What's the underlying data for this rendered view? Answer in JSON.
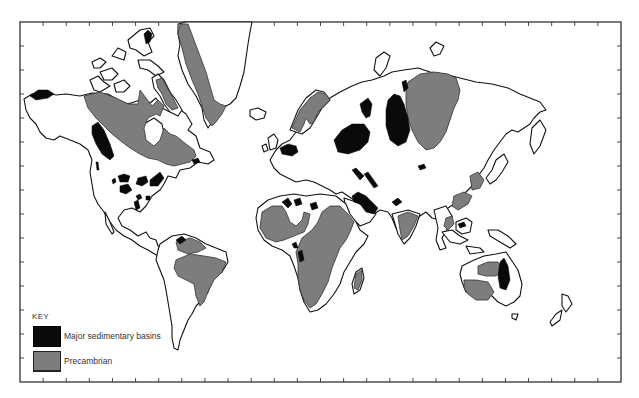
{
  "map": {
    "type": "world-map",
    "projection": "Mercator-style",
    "colors": {
      "land": "#ffffff",
      "coastline": "#111111",
      "major_sedimentary_basins": "#0a0a0a",
      "precambrian": "#7d7d7d",
      "frame": "#222222"
    },
    "frame": {
      "left": 20,
      "top": 22,
      "right": 621,
      "bottom": 382,
      "tick_marks": true
    }
  },
  "key": {
    "title": "KEY",
    "items": [
      {
        "label": "Major sedimentary basins",
        "swatch": "black"
      },
      {
        "label": "Precambrian",
        "swatch": "gray"
      }
    ]
  }
}
